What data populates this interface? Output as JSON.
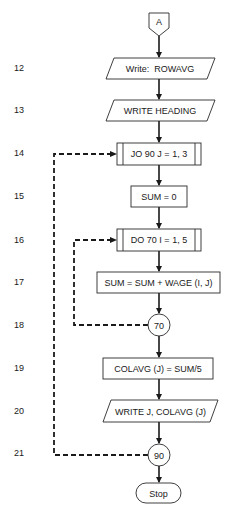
{
  "flowchart": {
    "connector_top": {
      "label": "A"
    },
    "row_numbers": [
      "12",
      "13",
      "14",
      "15",
      "16",
      "17",
      "18",
      "19",
      "20",
      "21"
    ],
    "steps": [
      {
        "line": "12",
        "type": "io",
        "label": "Write:  ROWAVG"
      },
      {
        "line": "13",
        "type": "io",
        "label": "WRITE HEADING"
      },
      {
        "line": "14",
        "type": "loop",
        "label": "JO 90 J = 1, 3"
      },
      {
        "line": "15",
        "type": "process",
        "label": "SUM = 0"
      },
      {
        "line": "16",
        "type": "loop",
        "label": "DO 70 I = 1, 5"
      },
      {
        "line": "17",
        "type": "process",
        "label": "SUM = SUM + WAGE (I, J)"
      },
      {
        "line": "18",
        "type": "connector",
        "label": "70"
      },
      {
        "line": "19",
        "type": "process",
        "label": "COLAVG (J) = SUM/5"
      },
      {
        "line": "20",
        "type": "io",
        "label": "WRITE J, COLAVG (J)"
      },
      {
        "line": "21",
        "type": "connector",
        "label": "90"
      }
    ],
    "terminal": {
      "label": "Stop"
    },
    "loops": [
      {
        "from": "90",
        "to": "JO 90 J = 1, 3",
        "style": "dashed"
      },
      {
        "from": "70",
        "to": "DO 70 I = 1, 5",
        "style": "dashed"
      }
    ]
  }
}
